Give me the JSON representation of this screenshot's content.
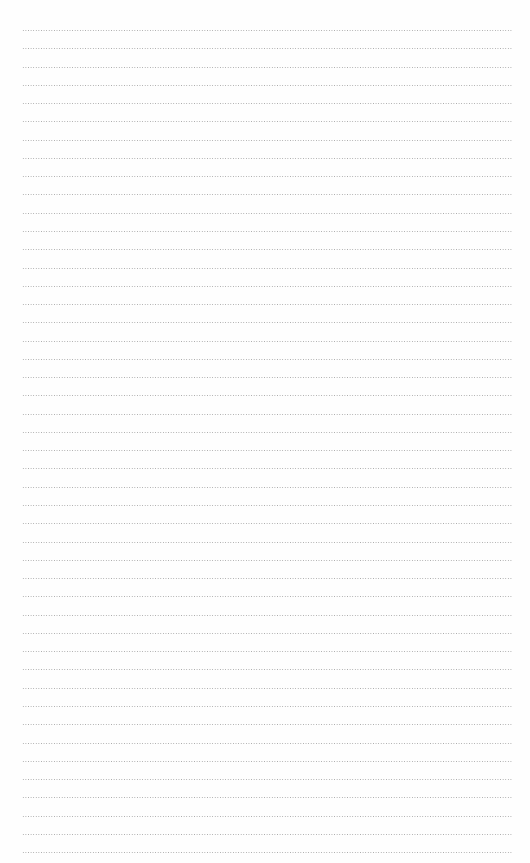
{
  "page": {
    "type": "dotted-lined-paper",
    "line_count": 46,
    "first_line_y": 30,
    "line_spacing": 18.27,
    "line_left": 22,
    "line_width": 490,
    "line_color": "#9a9a9a",
    "background": "#fefefe"
  }
}
